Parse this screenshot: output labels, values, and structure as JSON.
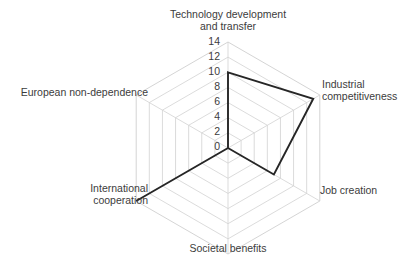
{
  "chart_data": {
    "type": "radar",
    "title": "",
    "subtitle": "",
    "xlabel": "",
    "ylabel": "",
    "grid": true,
    "legend_position": "none",
    "radial_range": [
      0,
      14
    ],
    "radial_ticks": [
      "0",
      "2",
      "4",
      "6",
      "8",
      "10",
      "12",
      "14"
    ],
    "radial_tick_values": [
      0,
      2,
      4,
      6,
      8,
      10,
      12,
      14
    ],
    "axis_start_angle_deg": -90,
    "axis_direction": "clockwise",
    "categories": [
      "Technology development\nand transfer",
      "Industrial\ncompetitiveness",
      "Job creation",
      "Societal benefits",
      "International\ncooperation",
      "European non-dependence"
    ],
    "series": [
      {
        "name": "",
        "values": [
          10,
          13,
          7,
          0,
          14,
          0
        ],
        "color": "#262626",
        "fill": "none"
      }
    ],
    "grid_color": "#d2d2d2",
    "background_color": "#ffffff"
  },
  "labels": {
    "technology": "Technology development\nand transfer",
    "industrial": "Industrial\ncompetitiveness",
    "job_creation": "Job creation",
    "societal": "Societal benefits",
    "international": "International\ncooperation",
    "european": "European non-dependence"
  },
  "ticks": {
    "t0": "0",
    "t2": "2",
    "t4": "4",
    "t6": "6",
    "t8": "8",
    "t10": "10",
    "t12": "12",
    "t14": "14"
  }
}
